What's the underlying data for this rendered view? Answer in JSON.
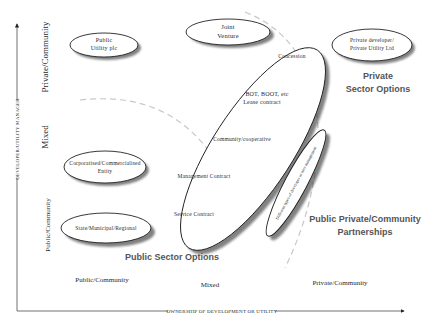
{
  "diagram": {
    "y_axis": {
      "title": "DEVELOPER/UTILITY MANAGER",
      "levels": [
        "Private/Community",
        "Mixed",
        "Public/Community"
      ]
    },
    "x_axis": {
      "title": "OWNERSHIP OF DEVELOPMENT OR UTILITY",
      "levels": [
        "Public/Community",
        "Mixed",
        "Private/Community"
      ]
    },
    "entities": {
      "public_utility": {
        "line1": "Public",
        "line2": "Utility plc"
      },
      "joint_venture": {
        "line1": "Joint",
        "line2": "Venture"
      },
      "private_developer": {
        "line1": "Private developer/",
        "line2": "Private Utility Ltd"
      },
      "corporatised": {
        "line1": "Corporatised/Commercialised",
        "line2": "Entity"
      },
      "state_municipal": {
        "label": "State/Municipal/Regional"
      }
    },
    "contract_spectrum": {
      "items": [
        "Concession",
        "BOT, BOOT, etc",
        "Lease contract",
        "Community/cooperative",
        "Management Contract",
        "Service Contract"
      ]
    },
    "management_band": {
      "label": "Different types of developer or user management"
    },
    "option_groups": {
      "private_sector": {
        "line1": "Private",
        "line2": "Sector Options"
      },
      "public_sector": {
        "label": "Public Sector Options"
      },
      "ppp": {
        "line1": "Public Private/Community",
        "line2": "Partnerships"
      }
    }
  }
}
